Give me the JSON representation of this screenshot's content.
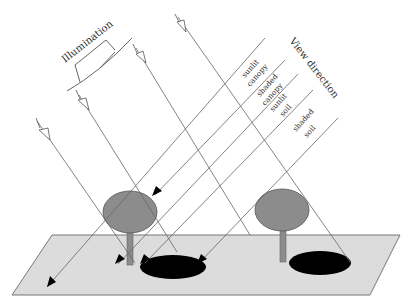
{
  "diagram": {
    "labels": {
      "illumination": "Illumination",
      "view_direction": "View direction",
      "sunlit_canopy": [
        "sunlit",
        "canopy"
      ],
      "shaded_canopy": [
        "shaded",
        "canopy"
      ],
      "sunlit_soil": [
        "sunlit",
        "soil"
      ],
      "shaded_soil": [
        "shaded",
        "soil"
      ]
    },
    "colors": {
      "ground": "#dcdcdc",
      "ground_stroke": "#777777",
      "canopy": "#8c8c8c",
      "canopy_stroke": "#555555",
      "stem": "#8c8c8c",
      "shadow": "#000000",
      "line": "#555555"
    },
    "elements": {
      "trees": [
        {
          "name": "left-tree"
        },
        {
          "name": "right-tree"
        }
      ],
      "illumination_rays": 4,
      "view_rays": 5
    }
  }
}
